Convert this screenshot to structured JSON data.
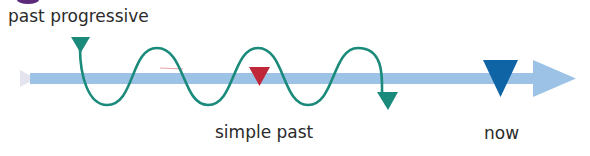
{
  "labels": {
    "past_progressive": "past progressive",
    "simple_past": "simple past",
    "now": "now"
  },
  "colors": {
    "timeline": "#9cc2e6",
    "timeline_start": "#e4e4ee",
    "wave": "#1a8a7a",
    "past_progressive_marker": "#1a8a7a",
    "simple_past_marker": "#c0283a",
    "now_marker": "#0f64a6",
    "accent_blob": "#5b2a78"
  },
  "diagram": {
    "type": "timeline",
    "elements": [
      {
        "id": "timeline-arrow",
        "description": "horizontal light-blue time axis pointing right"
      },
      {
        "id": "past-progressive-wave",
        "description": "teal wavy line spanning an interval in the past, ending in arrowhead"
      },
      {
        "id": "simple-past-marker",
        "description": "red downward triangle on timeline"
      },
      {
        "id": "now-marker",
        "description": "dark blue downward triangle on timeline"
      }
    ]
  }
}
